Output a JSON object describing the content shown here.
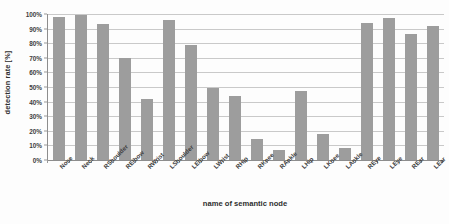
{
  "chart_data": {
    "type": "bar",
    "title": "",
    "xlabel": "name of semantic node",
    "ylabel": "detection rate [%]",
    "ylim": [
      0,
      100
    ],
    "ytick_labels": [
      "100%",
      "90%",
      "80%",
      "70%",
      "60%",
      "50%",
      "40%",
      "30%",
      "20%",
      "10%",
      "0%"
    ],
    "ytick_values": [
      100,
      90,
      80,
      70,
      60,
      50,
      40,
      30,
      20,
      10,
      0
    ],
    "grid": true,
    "legend": "none",
    "bar_color": "#9d9d9d",
    "gridline_color": "#c9c9c9",
    "axis_color": "#8d8d8d",
    "categories": [
      "Nose",
      "Neck",
      "RShoulder",
      "RElbow",
      "RWrist",
      "LShoulder",
      "LElbow",
      "LWrist",
      "RHip",
      "RKnee",
      "RAnkle",
      "LHip",
      "LKnee",
      "LAnkle",
      "REye",
      "LEye",
      "REar",
      "LEar"
    ],
    "values": [
      98,
      99,
      93,
      70,
      42,
      96,
      79,
      49.5,
      44,
      14.5,
      7,
      47,
      17.5,
      8,
      94,
      97,
      86,
      91.5
    ]
  }
}
